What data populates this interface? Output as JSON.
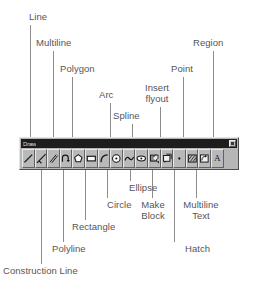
{
  "toolbar": {
    "title": "Draw",
    "close_button_label": "Close",
    "buttons": [
      {
        "name": "line",
        "icon": "line-icon"
      },
      {
        "name": "construction-line",
        "icon": "construction-line-icon"
      },
      {
        "name": "multiline",
        "icon": "multiline-icon"
      },
      {
        "name": "polyline",
        "icon": "polyline-icon"
      },
      {
        "name": "polygon",
        "icon": "polygon-icon"
      },
      {
        "name": "rectangle",
        "icon": "rectangle-icon"
      },
      {
        "name": "arc",
        "icon": "arc-icon"
      },
      {
        "name": "circle",
        "icon": "circle-icon"
      },
      {
        "name": "spline",
        "icon": "spline-icon"
      },
      {
        "name": "ellipse",
        "icon": "ellipse-icon"
      },
      {
        "name": "insert-flyout",
        "icon": "insert-block-icon"
      },
      {
        "name": "make-block",
        "icon": "make-block-icon"
      },
      {
        "name": "point",
        "icon": "point-icon"
      },
      {
        "name": "hatch",
        "icon": "hatch-icon"
      },
      {
        "name": "region",
        "icon": "region-icon"
      },
      {
        "name": "multiline-text",
        "icon": "text-a-icon",
        "glyph": "A"
      }
    ]
  },
  "callouts": {
    "above": [
      {
        "key": "line",
        "text": "Line"
      },
      {
        "key": "multiline",
        "text": "Multiline"
      },
      {
        "key": "polygon",
        "text": "Polygon"
      },
      {
        "key": "arc",
        "text": "Arc"
      },
      {
        "key": "spline",
        "text": "Spline"
      },
      {
        "key": "insert_flyout",
        "text": "Insert\nflyout"
      },
      {
        "key": "point",
        "text": "Point"
      },
      {
        "key": "region",
        "text": "Region"
      }
    ],
    "below": [
      {
        "key": "construction_line",
        "text": "Construction Line"
      },
      {
        "key": "polyline",
        "text": "Polyline"
      },
      {
        "key": "rectangle",
        "text": "Rectangle"
      },
      {
        "key": "circle",
        "text": "Circle"
      },
      {
        "key": "ellipse",
        "text": "Ellipse"
      },
      {
        "key": "make_block",
        "text": "Make\nBlock"
      },
      {
        "key": "hatch",
        "text": "Hatch"
      },
      {
        "key": "multiline_text",
        "text": "Multiline\nText"
      }
    ]
  },
  "colors": {
    "page_background": "#ffffff",
    "label_text": "#555556",
    "leader_line": "#8d8d8f",
    "toolbar_face": "#b6b6b6",
    "toolbar_titlebar": "#1d1d1d",
    "toolbar_title_text": "#dcdcdc",
    "button_face": "#b9b9b9",
    "icon_ink": "#171717"
  }
}
